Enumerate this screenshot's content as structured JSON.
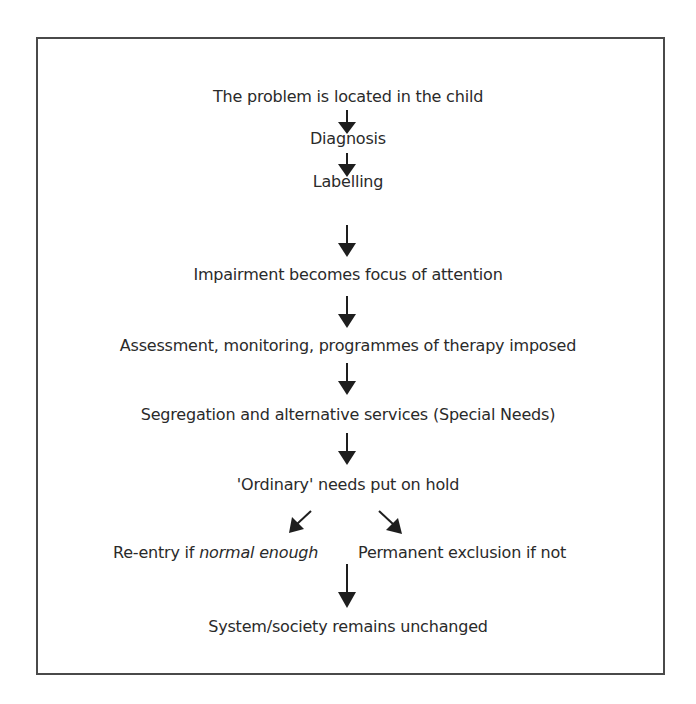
{
  "diagram": {
    "type": "flowchart",
    "nodes": [
      {
        "id": "n1",
        "label": "The problem is located in the child"
      },
      {
        "id": "n2",
        "label": "Diagnosis"
      },
      {
        "id": "n3",
        "label": "Labelling"
      },
      {
        "id": "n4",
        "label": "Impairment becomes focus of attention"
      },
      {
        "id": "n5",
        "label": "Assessment, monitoring, programmes of therapy imposed"
      },
      {
        "id": "n6",
        "label": "Segregation and alternative services (Special Needs)"
      },
      {
        "id": "n7",
        "label": "'Ordinary' needs put on hold"
      },
      {
        "id": "n8",
        "label_prefix": "Re-entry if ",
        "label_emphasis": "normal enough"
      },
      {
        "id": "n9",
        "label": "Permanent exclusion if not"
      },
      {
        "id": "n10",
        "label": "System/society remains unchanged"
      }
    ],
    "edges": [
      {
        "from": "n1",
        "to": "n2"
      },
      {
        "from": "n2",
        "to": "n3"
      },
      {
        "from": "n3",
        "to": "n4"
      },
      {
        "from": "n4",
        "to": "n5"
      },
      {
        "from": "n5",
        "to": "n6"
      },
      {
        "from": "n6",
        "to": "n7"
      },
      {
        "from": "n7",
        "to": "n8"
      },
      {
        "from": "n7",
        "to": "n9"
      },
      {
        "from": "n8",
        "to": "n10"
      }
    ],
    "colors": {
      "text": "#2a2a2a",
      "arrow": "#1e1e1e",
      "border": "#4a4a4a",
      "background": "#ffffff"
    }
  }
}
